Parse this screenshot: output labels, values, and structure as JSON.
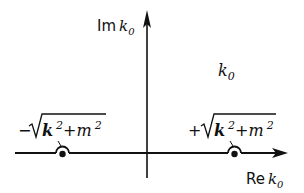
{
  "diagram": {
    "type": "complex-plane-contour",
    "plane_label": "k0",
    "axes": {
      "imaginary": {
        "label_prefix": "Im",
        "label_var": "k",
        "label_sub": "0"
      },
      "real": {
        "label_prefix": "Re",
        "label_var": "k",
        "label_sub": "0"
      }
    },
    "plane": {
      "label_var": "k",
      "label_sub": "0"
    },
    "poles": [
      {
        "sign": "−",
        "k": "k",
        "m": "m",
        "exp": "2",
        "plus": "+",
        "position": "negative-real-axis",
        "contour_detour": "above"
      },
      {
        "sign": "+",
        "k": "k",
        "m": "m",
        "exp": "2",
        "plus": "+",
        "position": "positive-real-axis",
        "contour_detour": "above"
      }
    ],
    "color": "#111111"
  }
}
